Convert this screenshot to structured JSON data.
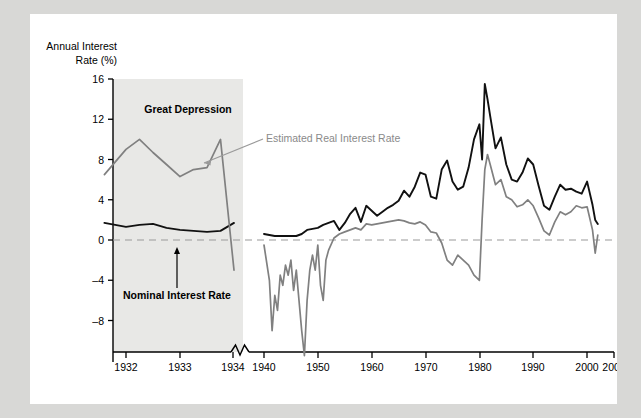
{
  "figure": {
    "y_axis_title_line1": "Annual Interest",
    "y_axis_title_line2": "Rate (%)",
    "colors": {
      "nominal_line": "#111111",
      "real_line": "#808080",
      "shaded_band": "#e8e8e6",
      "zero_line": "#999999",
      "panel_background": "#ffffff",
      "page_background": "#d8d8d6"
    },
    "annotations": [
      {
        "name": "great-depression",
        "text": "Great Depression",
        "style": "bold-black"
      },
      {
        "name": "estimated-real-interest-rate",
        "text": "Estimated Real Interest Rate",
        "style": "gray"
      },
      {
        "name": "nominal-interest-rate",
        "text": "Nominal Interest Rate",
        "style": "bold-black"
      }
    ]
  },
  "chart_data": {
    "type": "line",
    "title": "",
    "xlabel": "",
    "ylabel": "Annual Interest Rate (%)",
    "ylim": [
      -12,
      16
    ],
    "yticks": [
      16,
      12,
      8,
      4,
      0,
      -4,
      -8
    ],
    "xticks": [
      "1932",
      "1933",
      "1934",
      "1940",
      "1950",
      "1960",
      "1970",
      "1980",
      "1990",
      "2000",
      "2005"
    ],
    "axis_break_after": "1934",
    "grid": false,
    "zero_reference_line": 0,
    "legend_position": "inline-annotations",
    "shaded_region": {
      "label": "Great Depression",
      "from": "1931.5",
      "to": "1934"
    },
    "series": [
      {
        "name": "Nominal Interest Rate",
        "color": "#111111",
        "x": [
          1931.6,
          1932,
          1932.25,
          1932.5,
          1932.75,
          1933,
          1933.25,
          1933.5,
          1933.75,
          1934,
          1940,
          1941,
          1942,
          1943,
          1944,
          1945,
          1946,
          1947,
          1948,
          1949,
          1950,
          1951,
          1952,
          1953,
          1954,
          1955,
          1956,
          1957,
          1958,
          1959,
          1960,
          1961,
          1962,
          1963,
          1964,
          1965,
          1966,
          1967,
          1968,
          1969,
          1970,
          1971,
          1972,
          1973,
          1974,
          1975,
          1976,
          1977,
          1978,
          1979,
          1980,
          1980.5,
          1981,
          1981.5,
          1982,
          1983,
          1984,
          1985,
          1986,
          1987,
          1988,
          1989,
          1990,
          1991,
          1992,
          1993,
          1994,
          1995,
          1996,
          1997,
          1998,
          1999,
          2000,
          2001,
          2001.5,
          2002
        ],
        "values": [
          1.7,
          1.3,
          1.5,
          1.6,
          1.2,
          1.0,
          0.9,
          0.8,
          0.9,
          1.7,
          0.6,
          0.5,
          0.4,
          0.4,
          0.4,
          0.4,
          0.4,
          0.6,
          1.0,
          1.1,
          1.2,
          1.5,
          1.7,
          1.9,
          1.0,
          1.7,
          2.6,
          3.2,
          1.8,
          3.4,
          2.9,
          2.4,
          2.8,
          3.2,
          3.5,
          3.9,
          4.9,
          4.3,
          5.3,
          6.7,
          6.5,
          4.3,
          4.1,
          7.0,
          7.9,
          5.8,
          5.0,
          5.3,
          7.2,
          10.0,
          11.5,
          8.0,
          15.5,
          14.0,
          12.3,
          9.1,
          10.2,
          7.5,
          6.0,
          5.8,
          6.7,
          8.1,
          7.5,
          5.4,
          3.4,
          3.0,
          4.3,
          5.5,
          5.0,
          5.1,
          4.8,
          4.6,
          5.8,
          3.5,
          2.0,
          1.6
        ]
      },
      {
        "name": "Estimated Real Interest Rate",
        "color": "#808080",
        "x": [
          1931.6,
          1932,
          1932.25,
          1932.5,
          1932.75,
          1933,
          1933.25,
          1933.5,
          1933.75,
          1934,
          1940,
          1941,
          1941.5,
          1942,
          1942.5,
          1943,
          1943.5,
          1944,
          1944.5,
          1945,
          1945.5,
          1946,
          1946.5,
          1947,
          1947.5,
          1948,
          1948.5,
          1949,
          1949.5,
          1950,
          1950.5,
          1951,
          1951.5,
          1952,
          1953,
          1954,
          1955,
          1956,
          1957,
          1958,
          1959,
          1960,
          1961,
          1962,
          1963,
          1964,
          1965,
          1966,
          1967,
          1968,
          1969,
          1970,
          1971,
          1972,
          1973,
          1974,
          1975,
          1976,
          1977,
          1978,
          1979,
          1980,
          1980.5,
          1981,
          1981.5,
          1982,
          1983,
          1984,
          1985,
          1986,
          1987,
          1988,
          1989,
          1990,
          1991,
          1992,
          1993,
          1994,
          1995,
          1996,
          1997,
          1998,
          1999,
          2000,
          2001,
          2001.5,
          2002
        ],
        "values": [
          6.5,
          9.0,
          10.0,
          8.7,
          7.5,
          6.3,
          7.0,
          7.2,
          10.0,
          -3.0,
          -0.5,
          -4.0,
          -9.0,
          -5.5,
          -7.0,
          -3.5,
          -4.5,
          -2.5,
          -3.5,
          -2.0,
          -5.0,
          -3.0,
          -6.0,
          -9.0,
          -11.5,
          -6.0,
          -3.0,
          -1.5,
          -3.0,
          -0.5,
          -4.5,
          -6.0,
          -2.0,
          -1.0,
          0.2,
          0.6,
          0.8,
          1.0,
          1.2,
          1.0,
          1.6,
          1.5,
          1.6,
          1.7,
          1.8,
          1.9,
          2.0,
          1.9,
          1.7,
          1.6,
          1.8,
          1.5,
          0.8,
          0.7,
          -0.3,
          -2.0,
          -2.5,
          -1.5,
          -2.0,
          -2.5,
          -3.5,
          -4.0,
          2.0,
          7.0,
          8.5,
          7.5,
          5.5,
          6.0,
          4.3,
          4.0,
          3.3,
          3.5,
          4.0,
          3.4,
          2.2,
          0.9,
          0.5,
          1.8,
          2.8,
          2.5,
          2.8,
          3.4,
          3.2,
          3.3,
          1.0,
          -1.3,
          0.5
        ]
      }
    ]
  }
}
